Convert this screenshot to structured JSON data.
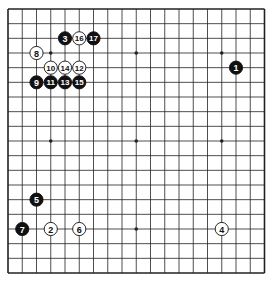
{
  "board": {
    "size": 19,
    "line_color": "#222222",
    "background": "#ffffff",
    "star_points": [
      [
        3,
        3
      ],
      [
        9,
        3
      ],
      [
        15,
        3
      ],
      [
        3,
        9
      ],
      [
        9,
        9
      ],
      [
        15,
        9
      ],
      [
        3,
        15
      ],
      [
        9,
        15
      ],
      [
        15,
        15
      ]
    ]
  },
  "colors": {
    "black_stone": "#111111",
    "white_stone": "#ffffff",
    "black_label": "#ffffff",
    "white_label": "#111111"
  },
  "moves": [
    {
      "number": "1",
      "color": "black",
      "col": 16,
      "row": 4
    },
    {
      "number": "2",
      "color": "white",
      "col": 3,
      "row": 15
    },
    {
      "number": "3",
      "color": "black",
      "col": 4,
      "row": 2
    },
    {
      "number": "4",
      "color": "white",
      "col": 15,
      "row": 15
    },
    {
      "number": "5",
      "color": "black",
      "col": 2,
      "row": 13
    },
    {
      "number": "6",
      "color": "white",
      "col": 5,
      "row": 15
    },
    {
      "number": "7",
      "color": "black",
      "col": 1,
      "row": 15
    },
    {
      "number": "8",
      "color": "white",
      "col": 2,
      "row": 3
    },
    {
      "number": "9",
      "color": "black",
      "col": 2,
      "row": 5
    },
    {
      "number": "10",
      "color": "white",
      "col": 3,
      "row": 4
    },
    {
      "number": "11",
      "color": "black",
      "col": 3,
      "row": 5
    },
    {
      "number": "12",
      "color": "white",
      "col": 5,
      "row": 4
    },
    {
      "number": "13",
      "color": "black",
      "col": 4,
      "row": 5
    },
    {
      "number": "14",
      "color": "white",
      "col": 4,
      "row": 4
    },
    {
      "number": "15",
      "color": "black",
      "col": 5,
      "row": 5
    },
    {
      "number": "16",
      "color": "white",
      "col": 5,
      "row": 2
    },
    {
      "number": "17",
      "color": "black",
      "col": 6,
      "row": 2
    }
  ]
}
